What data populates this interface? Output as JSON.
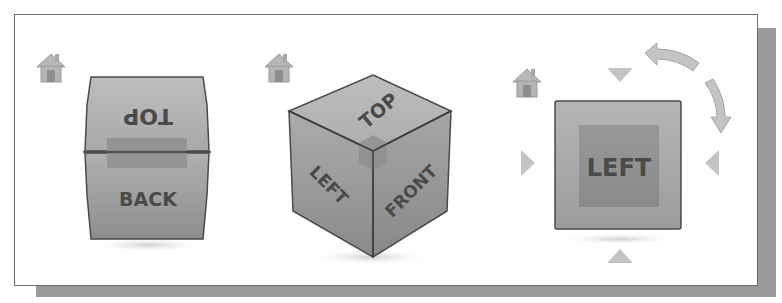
{
  "viewcubes": [
    {
      "id": "back-view",
      "home_icon": "home-icon",
      "faces": {
        "top": "TOP",
        "front": "BACK"
      },
      "orientation": "tilted-back"
    },
    {
      "id": "isometric-view",
      "home_icon": "home-icon",
      "faces": {
        "top": "TOP",
        "left": "LEFT",
        "front": "FRONT"
      },
      "orientation": "isometric"
    },
    {
      "id": "left-view",
      "home_icon": "home-icon",
      "faces": {
        "front": "LEFT"
      },
      "orientation": "orthographic",
      "controls": [
        "arrow-up",
        "arrow-down",
        "arrow-left",
        "arrow-right",
        "rotate-counterclockwise",
        "rotate-clockwise"
      ]
    }
  ],
  "colors": {
    "face_fill": "#a8a8a8",
    "face_dark": "#8a8a8a",
    "highlight": "#8f8f8f",
    "outline": "#4a4a4a",
    "arrow": "#c4c4c4",
    "frame_shadow": "#9a9a9a"
  }
}
